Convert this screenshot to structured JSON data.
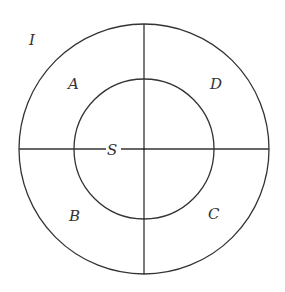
{
  "diagram": {
    "type": "concentric-circles-quadrants",
    "center": {
      "x": 144,
      "y": 149
    },
    "outer_radius": 125,
    "inner_radius": 70,
    "stroke_color": "#333333",
    "background": "#ffffff",
    "labels": {
      "outer": "I",
      "top_left": "A",
      "top_right": "D",
      "bottom_left": "B",
      "bottom_right": "C",
      "center": "S"
    }
  }
}
